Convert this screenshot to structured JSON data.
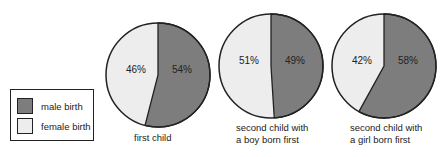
{
  "chart_data": {
    "type": "pie",
    "title": "",
    "legend": {
      "position": "left",
      "entries": [
        {
          "label": "male birth",
          "color": "#7d7d7d"
        },
        {
          "label": "female birth",
          "color": "#ededed"
        }
      ]
    },
    "charts": [
      {
        "caption": [
          "first child"
        ],
        "series": [
          {
            "name": "male birth",
            "value": 54,
            "label": "54%"
          },
          {
            "name": "female birth",
            "value": 46,
            "label": "46%"
          }
        ]
      },
      {
        "caption": [
          "second child with",
          "a boy born first"
        ],
        "series": [
          {
            "name": "male birth",
            "value": 49,
            "label": "49%"
          },
          {
            "name": "female birth",
            "value": 51,
            "label": "51%"
          }
        ]
      },
      {
        "caption": [
          "second child with",
          "a girl born first"
        ],
        "series": [
          {
            "name": "male birth",
            "value": 58,
            "label": "58%"
          },
          {
            "name": "female birth",
            "value": 42,
            "label": "42%"
          }
        ]
      }
    ]
  },
  "legend": {
    "male_label": "male birth",
    "female_label": "female birth",
    "male_color": "#7d7d7d",
    "female_color": "#ededed"
  },
  "pies": [
    {
      "male_label": "54%",
      "female_label": "46%",
      "male": 54,
      "caption1": "first child",
      "caption2": ""
    },
    {
      "male_label": "49%",
      "female_label": "51%",
      "male": 49,
      "caption1": "second child with",
      "caption2": "a boy born first"
    },
    {
      "male_label": "58%",
      "female_label": "42%",
      "male": 58,
      "caption1": "second child with",
      "caption2": "a girl born first"
    }
  ]
}
